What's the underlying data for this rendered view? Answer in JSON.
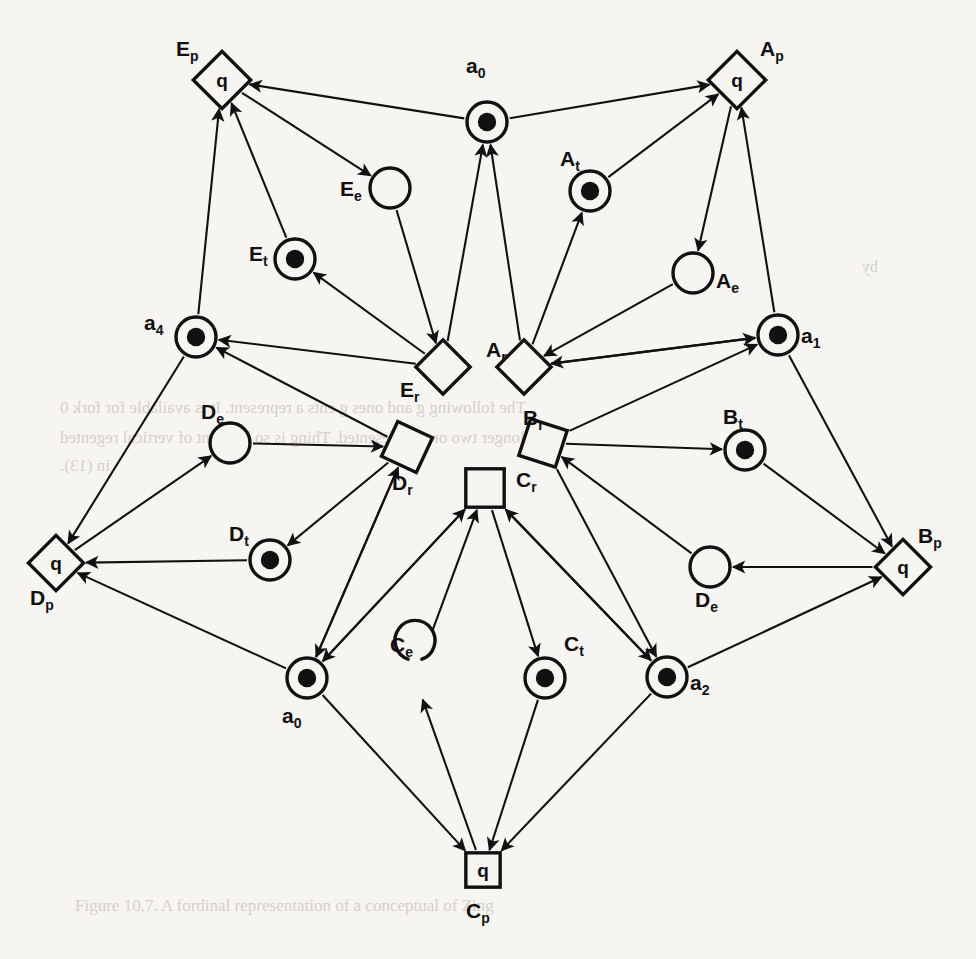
{
  "figure": {
    "type": "petri-net-diagram",
    "title": "",
    "background_color": "#f7f5f2",
    "ink_color": "#111111"
  },
  "glyphs": {
    "place_token_label": "q",
    "marked_place_token": "●"
  },
  "nodes": [
    {
      "id": "Ep",
      "label": "E",
      "sub": "p",
      "kind": "diamond-q",
      "x": 222,
      "y": 80,
      "r": 26,
      "rot": 45,
      "text": "q",
      "label_x": 176,
      "label_y": 56,
      "marked": false
    },
    {
      "id": "a0_top",
      "label": "a",
      "sub": "0",
      "kind": "token-circle",
      "x": 487,
      "y": 122,
      "r": 20,
      "label_x": 466,
      "label_y": 73,
      "marked": true
    },
    {
      "id": "Ap",
      "label": "A",
      "sub": "p",
      "kind": "diamond-q",
      "x": 737,
      "y": 80,
      "r": 26,
      "rot": 45,
      "text": "q",
      "label_x": 760,
      "label_y": 56,
      "marked": false
    },
    {
      "id": "Ee",
      "label": "E",
      "sub": "e",
      "kind": "empty-circle",
      "x": 390,
      "y": 188,
      "r": 20,
      "label_x": 340,
      "label_y": 196,
      "marked": false
    },
    {
      "id": "At",
      "label": "A",
      "sub": "t",
      "kind": "token-circle",
      "x": 590,
      "y": 191,
      "r": 20,
      "label_x": 560,
      "label_y": 166,
      "marked": true
    },
    {
      "id": "Et",
      "label": "E",
      "sub": "t",
      "kind": "token-circle",
      "x": 295,
      "y": 259,
      "r": 20,
      "label_x": 249,
      "label_y": 261,
      "marked": true
    },
    {
      "id": "Ae",
      "label": "A",
      "sub": "e",
      "kind": "empty-circle",
      "x": 693,
      "y": 273,
      "r": 20,
      "label_x": 716,
      "label_y": 288,
      "marked": false
    },
    {
      "id": "a4",
      "label": "a",
      "sub": "4",
      "kind": "token-circle",
      "x": 196,
      "y": 337,
      "r": 20,
      "label_x": 144,
      "label_y": 330,
      "marked": true
    },
    {
      "id": "a1",
      "label": "a",
      "sub": "1",
      "kind": "token-circle",
      "x": 778,
      "y": 335,
      "r": 20,
      "label_x": 801,
      "label_y": 343,
      "marked": true
    },
    {
      "id": "Er",
      "label": "E",
      "sub": "r",
      "kind": "square",
      "x": 443,
      "y": 367,
      "r": 24,
      "rot": 45,
      "label_x": 400,
      "label_y": 397,
      "marked": false
    },
    {
      "id": "Ar",
      "label": "A",
      "sub": "r",
      "kind": "square",
      "x": 524,
      "y": 367,
      "r": 24,
      "rot": 45,
      "label_x": 486,
      "label_y": 357,
      "marked": false
    },
    {
      "id": "De_left",
      "label": "D",
      "sub": "e",
      "kind": "empty-circle",
      "x": 230,
      "y": 443,
      "r": 20,
      "label_x": 201,
      "label_y": 419,
      "marked": false
    },
    {
      "id": "Dr",
      "label": "D",
      "sub": "r",
      "kind": "square",
      "x": 407,
      "y": 447,
      "r": 24,
      "rot": 25,
      "label_x": 392,
      "label_y": 490,
      "marked": false
    },
    {
      "id": "Br",
      "label": "B",
      "sub": "r",
      "kind": "square",
      "x": 543,
      "y": 443,
      "r": 24,
      "rot": 18,
      "label_x": 523,
      "label_y": 425,
      "marked": false
    },
    {
      "id": "Bt",
      "label": "B",
      "sub": "t",
      "kind": "token-circle",
      "x": 745,
      "y": 450,
      "r": 20,
      "label_x": 723,
      "label_y": 424,
      "marked": true
    },
    {
      "id": "Cr",
      "label": "C",
      "sub": "r",
      "kind": "square",
      "x": 485,
      "y": 488,
      "r": 24,
      "rot": 0,
      "label_x": 516,
      "label_y": 487,
      "marked": false
    },
    {
      "id": "Dp",
      "label": "D",
      "sub": "p",
      "kind": "diamond-q",
      "x": 56,
      "y": 563,
      "r": 25,
      "rot": 45,
      "text": "q",
      "label_x": 30,
      "label_y": 605,
      "marked": false
    },
    {
      "id": "Dt",
      "label": "D",
      "sub": "t",
      "kind": "token-circle",
      "x": 270,
      "y": 560,
      "r": 20,
      "label_x": 229,
      "label_y": 541,
      "marked": true
    },
    {
      "id": "De_right",
      "label": "D",
      "sub": "e",
      "kind": "empty-circle",
      "x": 710,
      "y": 567,
      "r": 20,
      "label_x": 695,
      "label_y": 607,
      "marked": false
    },
    {
      "id": "Bp",
      "label": "B",
      "sub": "p",
      "kind": "diamond-q",
      "x": 903,
      "y": 567,
      "r": 25,
      "rot": 45,
      "text": "q",
      "label_x": 918,
      "label_y": 543,
      "marked": false
    },
    {
      "id": "a0_bot",
      "label": "a",
      "sub": "0",
      "kind": "token-circle",
      "x": 307,
      "y": 678,
      "r": 20,
      "label_x": 282,
      "label_y": 723,
      "marked": true
    },
    {
      "id": "Ce",
      "label": "C",
      "sub": "e",
      "kind": "open-circle",
      "x": 415,
      "y": 678,
      "r": 20,
      "label_x": 390,
      "label_y": 652,
      "marked": false
    },
    {
      "id": "Ct",
      "label": "C",
      "sub": "t",
      "kind": "token-circle",
      "x": 545,
      "y": 678,
      "r": 20,
      "label_x": 564,
      "label_y": 651,
      "marked": true
    },
    {
      "id": "a2",
      "label": "a",
      "sub": "2",
      "kind": "token-circle",
      "x": 667,
      "y": 677,
      "r": 20,
      "label_x": 690,
      "label_y": 690,
      "marked": true
    },
    {
      "id": "Cp",
      "label": "C",
      "sub": "p",
      "kind": "square-q",
      "x": 483,
      "y": 870,
      "r": 22,
      "rot": 0,
      "text": "q",
      "label_x": 466,
      "label_y": 918,
      "marked": false
    }
  ],
  "edges": [
    {
      "from": "a0_top",
      "to": "Ep",
      "arrow": true
    },
    {
      "from": "Ep",
      "to": "Ee",
      "arrow": true
    },
    {
      "from": "Ee",
      "to": "Er",
      "arrow": true
    },
    {
      "from": "Er",
      "to": "Et",
      "arrow": true
    },
    {
      "from": "Et",
      "to": "Ep",
      "arrow": true
    },
    {
      "from": "a4",
      "to": "Ep",
      "arrow": true
    },
    {
      "from": "Er",
      "to": "a4",
      "arrow": true
    },
    {
      "from": "Er",
      "to": "a0_top",
      "arrow": true
    },
    {
      "from": "a0_top",
      "to": "Ap",
      "arrow": true
    },
    {
      "from": "Ap",
      "to": "Ae",
      "arrow": true
    },
    {
      "from": "Ae",
      "to": "Ar",
      "arrow": true
    },
    {
      "from": "Ar",
      "to": "At",
      "arrow": true
    },
    {
      "from": "At",
      "to": "Ap",
      "arrow": true
    },
    {
      "from": "a1",
      "to": "Ap",
      "arrow": true
    },
    {
      "from": "Ar",
      "to": "a1",
      "arrow": true
    },
    {
      "from": "Ar",
      "to": "a0_top",
      "arrow": true
    },
    {
      "from": "a1",
      "to": "Ar",
      "arrow": true
    },
    {
      "from": "Br",
      "to": "Bt",
      "arrow": true
    },
    {
      "from": "Bt",
      "to": "Bp",
      "arrow": true
    },
    {
      "from": "a1",
      "to": "Bp",
      "arrow": true
    },
    {
      "from": "Bp",
      "to": "De_right",
      "arrow": true
    },
    {
      "from": "De_right",
      "to": "Br",
      "arrow": true
    },
    {
      "from": "a2",
      "to": "Bp",
      "arrow": true
    },
    {
      "from": "Br",
      "to": "a1",
      "arrow": true
    },
    {
      "from": "Br",
      "to": "a2",
      "arrow": true
    },
    {
      "from": "Dp",
      "to": "De_left",
      "arrow": true
    },
    {
      "from": "De_left",
      "to": "Dr",
      "arrow": true
    },
    {
      "from": "Dr",
      "to": "Dt",
      "arrow": true
    },
    {
      "from": "Dt",
      "to": "Dp",
      "arrow": true
    },
    {
      "from": "a4",
      "to": "Dp",
      "arrow": true
    },
    {
      "from": "Dr",
      "to": "a4",
      "arrow": true
    },
    {
      "from": "Dr",
      "to": "a0_bot",
      "arrow": true
    },
    {
      "from": "a0_bot",
      "to": "Dp",
      "arrow": true
    },
    {
      "from": "a0_bot",
      "to": "Dr",
      "arrow": true
    },
    {
      "from": "Cp",
      "to": "Ce",
      "arrow": true
    },
    {
      "from": "Ce",
      "to": "Cr",
      "arrow": true
    },
    {
      "from": "Cr",
      "to": "Ct",
      "arrow": true
    },
    {
      "from": "Ct",
      "to": "Cp",
      "arrow": true
    },
    {
      "from": "a0_bot",
      "to": "Cp",
      "arrow": true
    },
    {
      "from": "a2",
      "to": "Cp",
      "arrow": true
    },
    {
      "from": "Cr",
      "to": "a0_bot",
      "arrow": true
    },
    {
      "from": "Cr",
      "to": "a2",
      "arrow": true
    },
    {
      "from": "a0_bot",
      "to": "Cr",
      "arrow": true
    },
    {
      "from": "a2",
      "to": "Cr",
      "arrow": true
    }
  ],
  "bleed_text": [
    {
      "text": "The following g and ones g ents a represent. It is available for fork 0",
      "x": 60,
      "y": 398,
      "size": 17
    },
    {
      "text": "the longer two or a represented. Thing is so has sent of vertical regented",
      "x": 60,
      "y": 428,
      "size": 17
    },
    {
      "text": "in (13).",
      "x": 60,
      "y": 456,
      "size": 17
    },
    {
      "text": "by",
      "x": 862,
      "y": 258,
      "size": 16
    },
    {
      "text": "Figure 10.7.  A fordinal representation of a conceptual of Zing",
      "x": 75,
      "y": 896,
      "size": 17
    }
  ]
}
